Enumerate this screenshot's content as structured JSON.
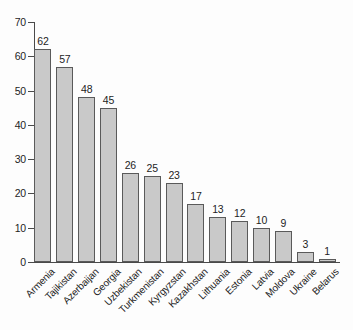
{
  "chart_data": {
    "type": "bar",
    "title": "",
    "subtitle": "",
    "xlabel": "",
    "ylabel": "",
    "ylim": [
      0,
      70
    ],
    "y_ticks": [
      0,
      10,
      20,
      30,
      40,
      50,
      60,
      70
    ],
    "grid": false,
    "legend": null,
    "bar_fill_color": "#c9c9c9",
    "bar_border_color": "#5a5a5a",
    "axis_color": "#4a4a4a",
    "background_color": "#fdfdfd",
    "text_color": "#1d1d1d",
    "value_labels_shown": true,
    "categories": [
      "Armenia",
      "Tajikistan",
      "Azerbaijan",
      "Georgia",
      "Uzbekistan",
      "Turkmenistan",
      "Kyrgyzstan",
      "Kazakhstan",
      "Lithuania",
      "Estonia",
      "Latvia",
      "Moldova",
      "Ukraine",
      "Belarus"
    ],
    "values": [
      62,
      57,
      48,
      45,
      26,
      25,
      23,
      17,
      13,
      12,
      10,
      9,
      3,
      1
    ]
  },
  "axis": {
    "y_tick_labels": [
      "0",
      "10",
      "20",
      "30",
      "40",
      "50",
      "60",
      "70"
    ]
  }
}
